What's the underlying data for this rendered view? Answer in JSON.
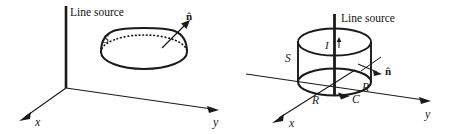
{
  "figure": {
    "caption_present": false,
    "background_color": "#ffffff",
    "ink_color": "#1a1a1a",
    "panels": [
      {
        "id": "left-panel",
        "name": "hemisphere-over-line-source",
        "line_source_label": "Line source",
        "surface_label": "S",
        "normal_label": "n̂",
        "axis_x_label": "x",
        "axis_y_label": "y",
        "shapes": [
          "vertical-line-source",
          "hemispherical-cap",
          "dotted-equator-ellipse",
          "normal-arrow",
          "x-axis-arrow",
          "y-axis-arrow"
        ]
      },
      {
        "id": "right-panel",
        "name": "cylinder-around-line-source",
        "line_source_label": "Line source",
        "current_label": "I",
        "surface_label": "S",
        "contour_label": "C",
        "radius_label_front": "R",
        "radius_label_right": "R",
        "normal_label": "n̂",
        "axis_x_label": "x",
        "axis_y_label": "y",
        "shapes": [
          "vertical-line-source",
          "cylinder-top-ellipse",
          "cylinder-bottom-ellipse",
          "cylinder-side-walls",
          "current-arrow",
          "contour-direction-arrow",
          "normal-arrow",
          "surface-patch-tick",
          "x-axis-arrow",
          "y-axis-arrow"
        ]
      }
    ]
  }
}
